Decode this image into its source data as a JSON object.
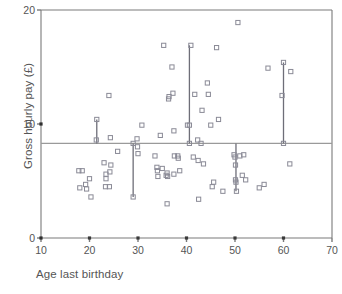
{
  "chart_data": {
    "type": "scatter",
    "title": "",
    "xlabel": "Age last birthday",
    "ylabel": "Gross hourly pay (£)",
    "xlim": [
      10,
      70
    ],
    "ylim": [
      0,
      20
    ],
    "xticks": [
      10,
      20,
      30,
      40,
      50,
      60,
      70
    ],
    "yticks": [
      0,
      10,
      20
    ],
    "grid": false,
    "legend": null,
    "marker": "open-square",
    "reference_line": {
      "orientation": "horizontal",
      "value": 8.3,
      "label": ""
    },
    "connector_lines": [
      {
        "x": 21.5,
        "y_from": 8.3,
        "y_to": 10.4
      },
      {
        "x": 29.0,
        "y_from": 3.6,
        "y_to": 8.3
      },
      {
        "x": 40.6,
        "y_from": 8.3,
        "y_to": 16.9
      },
      {
        "x": 50.2,
        "y_from": 4.1,
        "y_to": 8.3
      },
      {
        "x": 60.0,
        "y_from": 8.3,
        "y_to": 15.4
      }
    ],
    "points": [
      {
        "x": 17.8,
        "y": 5.9
      },
      {
        "x": 18.5,
        "y": 5.9
      },
      {
        "x": 18.0,
        "y": 4.4
      },
      {
        "x": 19.2,
        "y": 4.7
      },
      {
        "x": 19.4,
        "y": 4.3
      },
      {
        "x": 20.0,
        "y": 5.2
      },
      {
        "x": 20.3,
        "y": 3.6
      },
      {
        "x": 21.5,
        "y": 10.4
      },
      {
        "x": 21.4,
        "y": 8.6
      },
      {
        "x": 23.0,
        "y": 6.6
      },
      {
        "x": 23.4,
        "y": 5.6
      },
      {
        "x": 23.4,
        "y": 5.2
      },
      {
        "x": 23.3,
        "y": 4.5
      },
      {
        "x": 24.0,
        "y": 12.5
      },
      {
        "x": 24.3,
        "y": 8.8
      },
      {
        "x": 24.4,
        "y": 6.4
      },
      {
        "x": 24.2,
        "y": 5.8
      },
      {
        "x": 24.1,
        "y": 4.5
      },
      {
        "x": 25.8,
        "y": 7.6
      },
      {
        "x": 29.0,
        "y": 8.3
      },
      {
        "x": 29.0,
        "y": 3.6
      },
      {
        "x": 29.8,
        "y": 8.7
      },
      {
        "x": 29.9,
        "y": 8.0
      },
      {
        "x": 30.0,
        "y": 7.4
      },
      {
        "x": 30.8,
        "y": 9.9
      },
      {
        "x": 33.5,
        "y": 7.2
      },
      {
        "x": 33.9,
        "y": 6.2
      },
      {
        "x": 34.0,
        "y": 5.9
      },
      {
        "x": 34.1,
        "y": 5.4
      },
      {
        "x": 34.6,
        "y": 9.0
      },
      {
        "x": 35.0,
        "y": 6.1
      },
      {
        "x": 35.3,
        "y": 16.9
      },
      {
        "x": 35.8,
        "y": 5.5
      },
      {
        "x": 36.0,
        "y": 5.7
      },
      {
        "x": 36.1,
        "y": 5.4
      },
      {
        "x": 36.0,
        "y": 3.0
      },
      {
        "x": 36.3,
        "y": 12.2
      },
      {
        "x": 36.4,
        "y": 12.4
      },
      {
        "x": 37.0,
        "y": 15.0
      },
      {
        "x": 37.2,
        "y": 12.7
      },
      {
        "x": 37.4,
        "y": 9.4
      },
      {
        "x": 37.5,
        "y": 7.2
      },
      {
        "x": 37.4,
        "y": 5.6
      },
      {
        "x": 38.2,
        "y": 7.2
      },
      {
        "x": 38.3,
        "y": 7.0
      },
      {
        "x": 38.6,
        "y": 5.9
      },
      {
        "x": 40.2,
        "y": 9.9
      },
      {
        "x": 40.6,
        "y": 9.9
      },
      {
        "x": 40.6,
        "y": 8.3
      },
      {
        "x": 40.9,
        "y": 16.9
      },
      {
        "x": 41.4,
        "y": 7.1
      },
      {
        "x": 41.7,
        "y": 12.6
      },
      {
        "x": 42.3,
        "y": 8.6
      },
      {
        "x": 42.4,
        "y": 6.8
      },
      {
        "x": 42.5,
        "y": 3.4
      },
      {
        "x": 43.0,
        "y": 8.3
      },
      {
        "x": 43.2,
        "y": 11.2
      },
      {
        "x": 43.5,
        "y": 6.5
      },
      {
        "x": 44.3,
        "y": 13.6
      },
      {
        "x": 44.5,
        "y": 12.6
      },
      {
        "x": 45.0,
        "y": 9.9
      },
      {
        "x": 45.3,
        "y": 4.5
      },
      {
        "x": 45.6,
        "y": 4.9
      },
      {
        "x": 46.2,
        "y": 16.7
      },
      {
        "x": 46.6,
        "y": 10.4
      },
      {
        "x": 47.5,
        "y": 4.1
      },
      {
        "x": 49.8,
        "y": 7.3
      },
      {
        "x": 50.0,
        "y": 7.1
      },
      {
        "x": 50.1,
        "y": 6.4
      },
      {
        "x": 50.1,
        "y": 5.1
      },
      {
        "x": 50.2,
        "y": 4.9
      },
      {
        "x": 50.3,
        "y": 4.1
      },
      {
        "x": 50.6,
        "y": 18.9
      },
      {
        "x": 51.0,
        "y": 7.2
      },
      {
        "x": 51.5,
        "y": 5.5
      },
      {
        "x": 51.8,
        "y": 7.3
      },
      {
        "x": 52.2,
        "y": 5.1
      },
      {
        "x": 55.0,
        "y": 4.4
      },
      {
        "x": 56.0,
        "y": 4.7
      },
      {
        "x": 56.8,
        "y": 14.9
      },
      {
        "x": 59.7,
        "y": 12.5
      },
      {
        "x": 60.0,
        "y": 15.4
      },
      {
        "x": 60.0,
        "y": 8.3
      },
      {
        "x": 61.5,
        "y": 14.6
      },
      {
        "x": 61.3,
        "y": 6.5
      }
    ]
  },
  "style": {
    "axis_color": "#7a7a7a",
    "marker_color": "#8a8a96",
    "reference_line_color": "#9a9a9a",
    "connector_color": "#6e6e78",
    "text_color": "#555555",
    "background": "#ffffff"
  },
  "geometry": {
    "plot_left": 41,
    "plot_right": 332,
    "plot_top": 10,
    "plot_bottom": 238
  }
}
